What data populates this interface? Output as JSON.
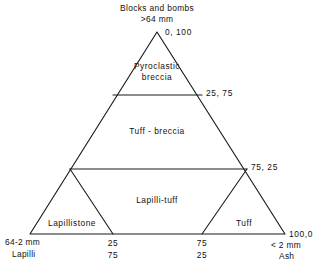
{
  "figure": {
    "type": "ternary-classification-diagram"
  },
  "apex": {
    "title": "Blocks and bombs",
    "size": ">64 mm",
    "coordinate": "0, 100"
  },
  "corners": {
    "left": {
      "size": "64-2 mm",
      "name": "Lapilli"
    },
    "right": {
      "size": "< 2 mm",
      "name": "Ash",
      "coordinate": "100,0"
    }
  },
  "edge_labels": {
    "upper_right": "25, 75",
    "lower_right": "75, 25"
  },
  "bottom_ticks": [
    {
      "top": "25",
      "bottom": "75"
    },
    {
      "top": "75",
      "bottom": "25"
    }
  ],
  "fields": [
    {
      "id": "pyroclastic-breccia",
      "line1": "Pyroclastic",
      "line2": "breccia"
    },
    {
      "id": "tuff-breccia",
      "line1": "Tuff - breccia",
      "line2": ""
    },
    {
      "id": "lapilli-tuff",
      "line1": "Lapilli-tuff",
      "line2": ""
    },
    {
      "id": "lapillistone",
      "line1": "Lapillistone",
      "line2": ""
    },
    {
      "id": "tuff",
      "line1": "Tuff",
      "line2": ""
    }
  ],
  "colors": {
    "ink": "#1b1b1b",
    "background": "#ffffff"
  }
}
